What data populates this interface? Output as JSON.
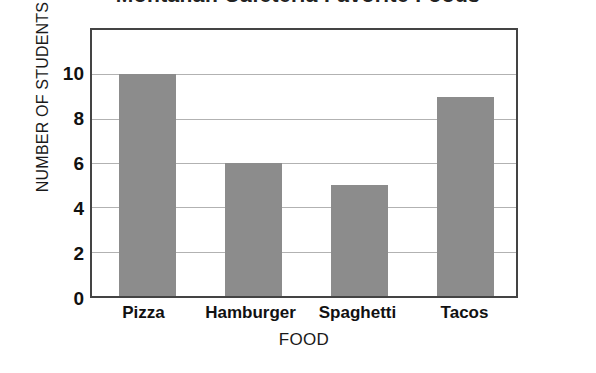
{
  "chart_data": {
    "type": "bar",
    "title": "Montanah Cafeteria Favorite Foods",
    "xlabel": "FOOD",
    "ylabel": "NUMBER OF STUDENTS",
    "categories": [
      "Pizza",
      "Hamburger",
      "Spaghetti",
      "Tacos"
    ],
    "values": [
      10,
      6,
      5,
      9
    ],
    "ylim": [
      0,
      12
    ],
    "ytick_values": [
      0,
      2,
      4,
      6,
      8,
      10
    ],
    "ytick_labels": [
      "0",
      "2",
      "4",
      "6",
      "8",
      "10"
    ],
    "grid": "horizontal",
    "legend": "none",
    "bar_color": "#8c8c8c",
    "gridline_color": "#b2b2b2",
    "frame_color": "#444444",
    "background_color": "#ffffff"
  }
}
